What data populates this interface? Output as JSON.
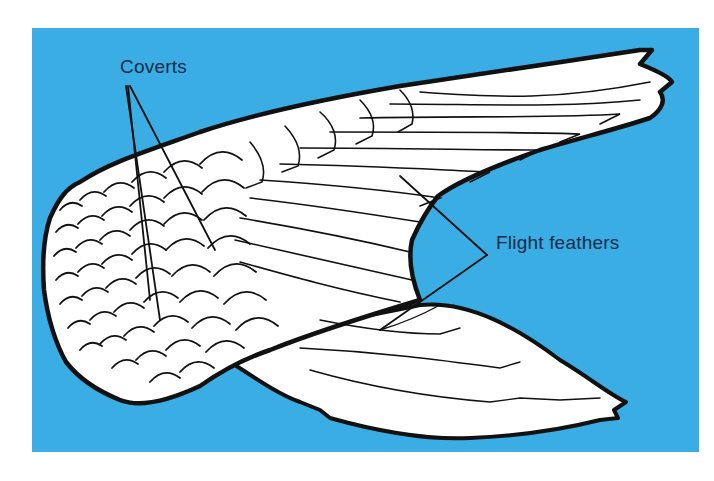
{
  "diagram": {
    "background_color": "#3aaee4",
    "page_color": "#ffffff",
    "wing_fill": "#ffffff",
    "line_color": "#111111",
    "label_color": "#0e2a4a",
    "labels": [
      {
        "id": "coverts",
        "text": "Coverts",
        "pointer_count": 3
      },
      {
        "id": "flight_feathers",
        "text": "Flight feathers",
        "pointer_count": 2
      }
    ]
  }
}
